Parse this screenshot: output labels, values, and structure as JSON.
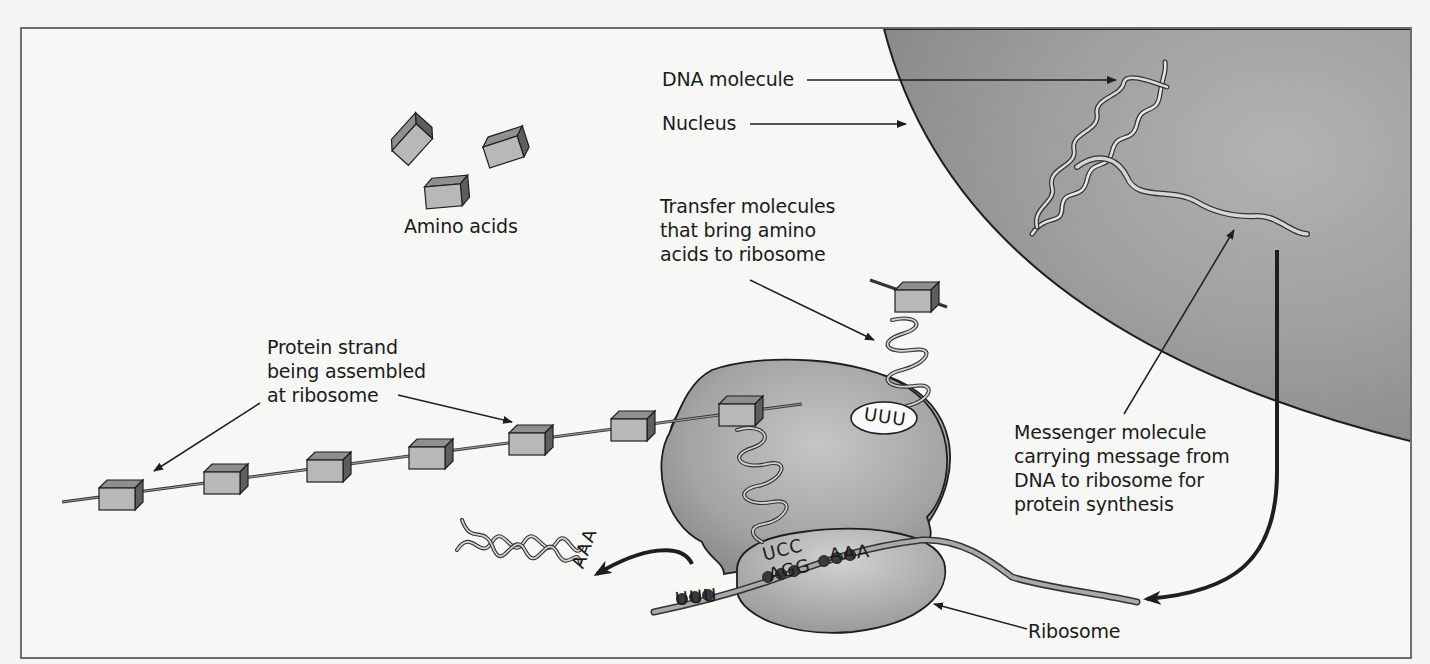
{
  "figure": {
    "labels": {
      "dna_molecule": "DNA molecule",
      "nucleus": "Nucleus",
      "amino_acids": "Amino acids",
      "transfer_molecules": "Transfer molecules\nthat bring amino\nacids to ribosome",
      "protein_strand": "Protein strand\nbeing assembled\nat ribosome",
      "messenger_molecule": "Messenger molecule\ncarrying message from\nDNA to ribosome for\nprotein synthesis",
      "ribosome": "Ribosome"
    },
    "codons": {
      "trna_top_anticodon": "UUU",
      "trna_bound_anticodon": "UCC",
      "mrna_codon_bound": "AGG",
      "mrna_codon_next": "AAA",
      "mrna_codon_exiting": "UUU",
      "released_trna_anticodon": "AAA"
    },
    "colors": {
      "nucleus_fill": "#9a9a9a",
      "ribosome_fill": "#a8a8a8",
      "amino_acid_fill": "#b5b5b5",
      "outline": "#1e1e1e",
      "frame_border": "#6d6d6d",
      "background": "#f7f7f5"
    }
  }
}
